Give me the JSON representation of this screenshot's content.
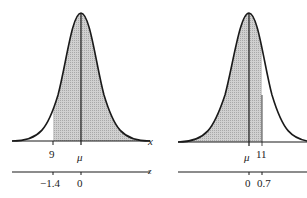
{
  "figure": {
    "panels": [
      {
        "id": "left",
        "description": "Shaded area to the right of x = 9",
        "x_axis": {
          "name": "x",
          "ticks": [
            {
              "value": "9"
            },
            {
              "value": "μ"
            }
          ]
        },
        "z_axis": {
          "name": "z",
          "ticks": [
            {
              "value": "−1.4"
            },
            {
              "value": "0"
            }
          ]
        },
        "shaded_region": "right of 9"
      },
      {
        "id": "right",
        "description": "Shaded area to the left of x = 11",
        "x_axis": {
          "name": "x",
          "ticks": [
            {
              "value": "μ"
            },
            {
              "value": "11"
            }
          ]
        },
        "z_axis": {
          "name": "z",
          "ticks": [
            {
              "value": "0"
            },
            {
              "value": "0.7"
            }
          ]
        },
        "shaded_region": "left of 11"
      }
    ],
    "colors": {
      "curve": "#1a1a1a",
      "shade": "#c8c8c8",
      "axis": "#1a1a1a"
    }
  }
}
